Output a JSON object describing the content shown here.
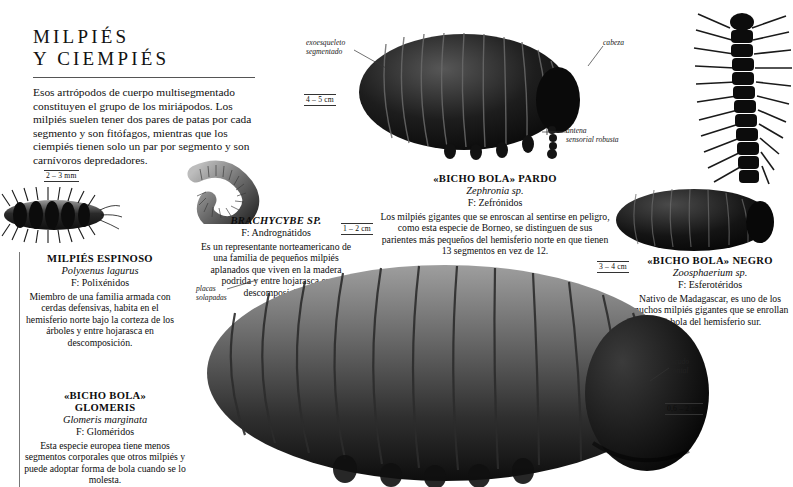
{
  "header": {
    "title_line1": "MILPIÉS",
    "title_line2": "Y  CIEMPIÉS",
    "intro": "Esos artrópodos de cuerpo multisegmentado constituyen el grupo de los miriápodos. Los milpiés suelen tener dos pares de patas por cada segmento y son fitófagos, mientras que los ciempiés tienen solo un par por segmento y son carnívoros depredadores."
  },
  "entries": [
    {
      "id": "milpies-espinoso",
      "common_name": "MILPIÉS ESPINOSO",
      "latin_name": "Polyxenus lagurus",
      "family": "F: Polixénidos",
      "description": "Miembro de una familia armada con cerdas defensivas, habita en el hemisferio norte bajo la corteza de los árboles y entre hojarasca en descomposición.",
      "scale": "2 – 3 mm"
    },
    {
      "id": "brachycybe",
      "common_name": "BRACHYCYBE SP.",
      "latin_name": "",
      "family": "F: Andrognátidos",
      "description": "Es un representante norteamericano de una familia de pequeños milpiés aplanados que viven en la madera podrida y entre hojarasca en descomposición.",
      "scale": "1 – 2 cm"
    },
    {
      "id": "bicho-bola-pardo",
      "common_name": "«BICHO BOLA» PARDO",
      "latin_name": "Zephronia sp.",
      "family": "F: Zefrónidos",
      "description": "Los milpiés gigantes que se enroscan al sentirse en peligro, como esta especie de Borneo, se distinguen de sus parientes más pequeños del hemisferio norte en que tienen 13 segmentos en vez de 12.",
      "scale": "4 – 5 cm"
    },
    {
      "id": "bicho-bola-negro",
      "common_name": "«BICHO BOLA» NEGRO",
      "latin_name": "Zoosphaerium sp.",
      "family": "F: Esferotéridos",
      "description": "Nativo de Madagascar, es uno de los muchos milpiés gigantes que se enrollan en bola del hemisferio sur.",
      "scale": "3 – 4 cm"
    },
    {
      "id": "bicho-bola-glomeris",
      "common_name_line1": "«BICHO BOLA»",
      "common_name_line2": "GLOMERIS",
      "latin_name": "Glomeris marginata",
      "family": "F: Gloméridos",
      "description": "Esta especie europea tiene menos segmentos corporales que otros milpiés y puede adoptar forma de bola cuando se lo molesta.",
      "scale": "0,6 – 2 cm"
    }
  ],
  "callouts": {
    "exoskeleton_line1": "exoesqueleto",
    "exoskeleton_line2": "segmentado",
    "head": "cabeza",
    "antenna_line1": "antena",
    "antenna_line2": "sensorial robusta",
    "plates_line1": "placas",
    "plates_line2": "solapadas",
    "shield_line1": "escudo",
    "shield_line2": "frontal"
  },
  "colors": {
    "ink": "#0d0d0d",
    "rule": "#555555",
    "specimen_dark": "#141414",
    "specimen_mid": "#4a4a4a",
    "specimen_light": "#9a9a9a"
  }
}
